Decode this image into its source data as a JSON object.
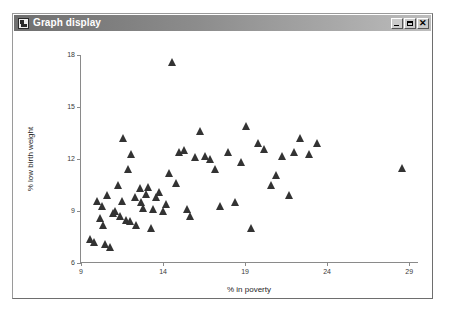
{
  "window": {
    "title": "Graph display",
    "icon": "graph-window-icon",
    "buttons": {
      "minimize": "_",
      "maximize": "□",
      "close": "✕"
    },
    "titlebar_color": "#8d8d8d",
    "background": "#ffffff"
  },
  "chart_data": {
    "type": "scatter",
    "title": "",
    "xlabel": "% in poverty",
    "ylabel": "% low birth weight",
    "xlim": [
      9,
      29.6
    ],
    "ylim": [
      6,
      18
    ],
    "xticks": [
      9,
      14,
      19,
      24,
      29
    ],
    "yticks": [
      6,
      9,
      12,
      15,
      18
    ],
    "grid": false,
    "legend": null,
    "marker": "triangle",
    "marker_color": "#333333",
    "series": [
      {
        "name": "states",
        "points": [
          [
            9.6,
            7.4
          ],
          [
            9.8,
            7.2
          ],
          [
            10.0,
            9.6
          ],
          [
            10.2,
            8.6
          ],
          [
            10.3,
            9.3
          ],
          [
            10.4,
            8.2
          ],
          [
            10.5,
            7.1
          ],
          [
            10.6,
            9.9
          ],
          [
            10.8,
            6.9
          ],
          [
            11.0,
            8.9
          ],
          [
            11.1,
            9.0
          ],
          [
            11.3,
            10.5
          ],
          [
            11.4,
            8.7
          ],
          [
            11.5,
            9.6
          ],
          [
            11.6,
            13.2
          ],
          [
            11.8,
            8.5
          ],
          [
            11.9,
            11.4
          ],
          [
            12.0,
            8.4
          ],
          [
            12.1,
            12.3
          ],
          [
            12.3,
            9.8
          ],
          [
            12.4,
            8.2
          ],
          [
            12.6,
            10.3
          ],
          [
            12.7,
            9.5
          ],
          [
            12.8,
            9.2
          ],
          [
            13.0,
            10.0
          ],
          [
            13.1,
            10.4
          ],
          [
            13.3,
            8.0
          ],
          [
            13.4,
            9.1
          ],
          [
            13.6,
            9.8
          ],
          [
            13.8,
            10.1
          ],
          [
            14.0,
            9.0
          ],
          [
            14.2,
            9.4
          ],
          [
            14.4,
            11.2
          ],
          [
            14.6,
            17.6
          ],
          [
            14.8,
            10.6
          ],
          [
            15.0,
            12.4
          ],
          [
            15.3,
            12.5
          ],
          [
            15.5,
            9.1
          ],
          [
            15.7,
            8.7
          ],
          [
            16.0,
            12.1
          ],
          [
            16.3,
            13.6
          ],
          [
            16.6,
            12.2
          ],
          [
            16.9,
            12.0
          ],
          [
            17.2,
            11.4
          ],
          [
            17.5,
            9.3
          ],
          [
            18.0,
            12.4
          ],
          [
            18.4,
            9.5
          ],
          [
            18.8,
            11.8
          ],
          [
            19.1,
            13.9
          ],
          [
            19.4,
            8.0
          ],
          [
            19.8,
            12.9
          ],
          [
            20.2,
            12.6
          ],
          [
            20.6,
            10.5
          ],
          [
            20.9,
            11.1
          ],
          [
            21.3,
            12.2
          ],
          [
            21.7,
            9.9
          ],
          [
            22.0,
            12.4
          ],
          [
            22.4,
            13.2
          ],
          [
            22.9,
            12.3
          ],
          [
            23.4,
            12.9
          ],
          [
            28.6,
            11.5
          ]
        ]
      }
    ]
  }
}
